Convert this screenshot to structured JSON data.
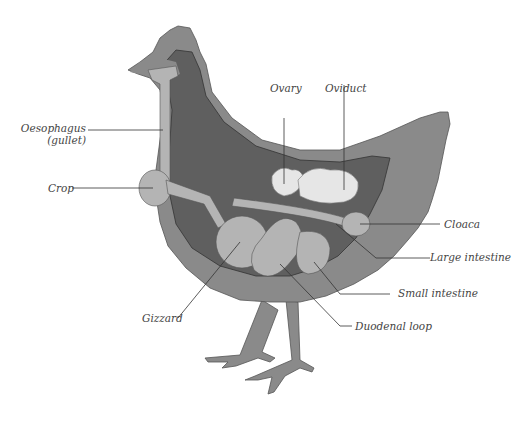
{
  "colors": {
    "background": "#ffffff",
    "outer_body": "#8a8a8a",
    "inner_cavity": "#5f5f5f",
    "organs": "#b4b4b4",
    "ovary_oviduct": "#e6e6e6",
    "leader_lines": "#333333",
    "label_text": "#444444"
  },
  "labels": {
    "oesophagus": "Oesophagus",
    "oesophagus_sub": "(gullet)",
    "crop": "Crop",
    "gizzard": "Gizzard",
    "ovary": "Ovary",
    "oviduct": "Oviduct",
    "cloaca": "Cloaca",
    "large_intestine": "Large intestine",
    "small_intestine": "Small intestine",
    "duodenal_loop": "Duodenal loop"
  }
}
